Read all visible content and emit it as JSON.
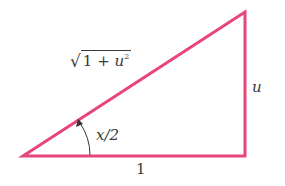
{
  "diagram": {
    "type": "right-triangle",
    "stroke_color": "#e8457a",
    "vertices": {
      "left": [
        23,
        156
      ],
      "top_right": [
        245,
        12
      ],
      "bottom_right": [
        245,
        156
      ]
    },
    "labels": {
      "hypotenuse_prefix": "1 + ",
      "hypotenuse_var": "u",
      "hypotenuse_exp": "2",
      "opposite": "u",
      "adjacent": "1",
      "angle": "x/2"
    }
  }
}
